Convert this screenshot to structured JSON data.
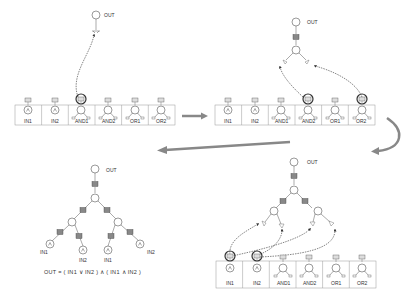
{
  "diagram": {
    "panels": [
      {
        "id": "panel-1",
        "output_label": "OUT",
        "palette": [
          "IN1",
          "IN2",
          "AND1",
          "AND2",
          "OR1",
          "OR2"
        ],
        "selected": [
          "AND1"
        ]
      },
      {
        "id": "panel-2",
        "output_label": "OUT",
        "palette": [
          "IN1",
          "IN2",
          "AND1",
          "AND2",
          "OR1",
          "OR2"
        ],
        "selected": [
          "AND2",
          "OR2"
        ]
      },
      {
        "id": "panel-3",
        "output_label": "OUT",
        "palette": [
          "IN1",
          "IN2",
          "AND1",
          "AND2",
          "OR1",
          "OR2"
        ],
        "selected": [
          "IN1",
          "IN2"
        ]
      },
      {
        "id": "panel-4",
        "output_label": "OUT",
        "leaf_labels": [
          "IN1",
          "IN2",
          "IN1",
          "IN2"
        ],
        "equation": "OUT = ( IN1 ∨ IN2 ) ∧ ( IN1 ∧ IN2 )"
      }
    ],
    "flow_arrows": [
      "panel-1 to panel-2",
      "panel-2 to panel-3",
      "panel-3 to panel-4"
    ],
    "colors": {
      "line": "#555555",
      "arrow": "#888888",
      "box_border": "#999999",
      "highlight": "#444444"
    }
  }
}
